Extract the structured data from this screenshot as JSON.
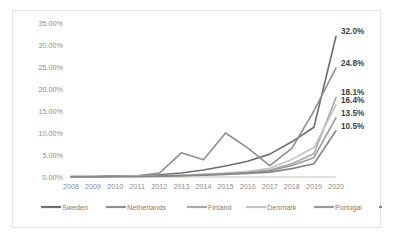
{
  "chart_data": {
    "type": "line",
    "title": "",
    "subtitle": "",
    "xlabel": "",
    "ylabel": "",
    "grid": false,
    "legend_position": "bottom",
    "categories": [
      "2008",
      "2009",
      "2010",
      "2011",
      "2012",
      "2013",
      "2014",
      "2015",
      "2016",
      "2017",
      "2018",
      "2019",
      "2020"
    ],
    "x": [
      2008,
      2009,
      2010,
      2011,
      2012,
      2013,
      2014,
      2015,
      2016,
      2017,
      2018,
      2019,
      2020
    ],
    "ylim": [
      0,
      35
    ],
    "yticks": [
      0,
      5,
      10,
      15,
      20,
      25,
      30,
      35
    ],
    "ytick_labels": [
      "0.00%",
      "5.00%",
      "10.00%",
      "15.00%",
      "20.00%",
      "25.00%",
      "30.00%",
      "35.00%"
    ],
    "series": [
      {
        "name": "Sweden",
        "color": "#6d6d6d",
        "values": [
          0.1,
          0.1,
          0.2,
          0.3,
          0.5,
          0.9,
          1.6,
          2.5,
          3.6,
          5.2,
          8.0,
          11.3,
          32.0
        ],
        "end_label": "32.0%"
      },
      {
        "name": "Netherlands",
        "color": "#8f8f8f",
        "values": [
          0.1,
          0.1,
          0.2,
          0.3,
          0.9,
          5.5,
          3.9,
          10.0,
          6.6,
          2.6,
          6.5,
          15.0,
          24.8
        ],
        "end_label": "24.8%"
      },
      {
        "name": "Finland",
        "color": "#a8a8a8",
        "values": [
          0.0,
          0.0,
          0.1,
          0.2,
          0.3,
          0.4,
          0.6,
          0.8,
          1.1,
          1.6,
          3.0,
          5.3,
          18.1
        ],
        "end_label": "18.1%"
      },
      {
        "name": "Denmark",
        "color": "#c2c2c2",
        "values": [
          0.0,
          0.0,
          0.1,
          0.2,
          0.3,
          0.4,
          0.6,
          0.9,
          1.3,
          2.0,
          4.0,
          6.7,
          16.4
        ],
        "end_label": "16.4%"
      },
      {
        "name": "Portugal",
        "color": "#9a9a9a",
        "values": [
          0.0,
          0.0,
          0.1,
          0.1,
          0.2,
          0.3,
          0.5,
          0.7,
          1.0,
          1.4,
          2.6,
          4.4,
          13.5
        ],
        "end_label": "13.5%"
      },
      {
        "name": "EU",
        "color": "#868686",
        "values": [
          0.0,
          0.0,
          0.1,
          0.1,
          0.2,
          0.3,
          0.4,
          0.6,
          0.8,
          1.1,
          1.9,
          3.0,
          10.5
        ],
        "end_label": "10.5%"
      }
    ],
    "data_labels": [
      "32.0%",
      "24.8%",
      "18.1%",
      "16.4%",
      "13.5%",
      "10.5%"
    ]
  },
  "legend": {
    "items": [
      {
        "label": "Sweden",
        "color": "#6d6d6d"
      },
      {
        "label": "Netherlands",
        "color": "#8f8f8f"
      },
      {
        "label": "Finland",
        "color": "#a8a8a8"
      },
      {
        "label": "Denmark",
        "color": "#c2c2c2"
      },
      {
        "label": "Portugal",
        "color": "#9a9a9a"
      },
      {
        "label": "EU",
        "color": "#868686"
      }
    ]
  }
}
